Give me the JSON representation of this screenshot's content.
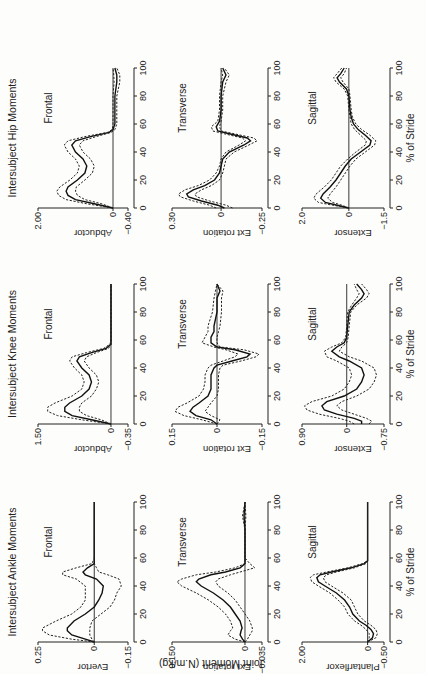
{
  "figure": {
    "ylabel_shared": "Joint Moment (N.m/kg)",
    "xlabel": "% of Stride",
    "x_ticks": [
      "0",
      "20",
      "40",
      "60",
      "80",
      "100"
    ]
  },
  "chart_data": [
    {
      "type": "line",
      "group": "ankle",
      "title": "Intersubject Ankle Moments",
      "panel_label": "Frontal",
      "ylabel": "Evertor",
      "xlabel": "",
      "ylim": [
        -0.15,
        0.25
      ],
      "ytick_labels": [
        "0.25",
        "0",
        "−0.15"
      ],
      "x": [
        0,
        2,
        5,
        8,
        10,
        15,
        20,
        25,
        30,
        35,
        40,
        45,
        48,
        50,
        53,
        56,
        60,
        70,
        80,
        90,
        100
      ],
      "series": [
        {
          "name": "mean",
          "values": [
            0,
            0.04,
            0.1,
            0.12,
            0.12,
            0.09,
            0.04,
            0.0,
            -0.02,
            -0.035,
            -0.04,
            -0.01,
            0.04,
            0.05,
            0.03,
            0.0,
            0,
            0,
            0,
            0,
            0
          ]
        },
        {
          "name": "+1 SD",
          "values": [
            0,
            0.1,
            0.2,
            0.23,
            0.23,
            0.17,
            0.1,
            0.06,
            0.04,
            0.04,
            0.04,
            0.08,
            0.14,
            0.14,
            0.08,
            0.01,
            0,
            0,
            0,
            0,
            0
          ]
        },
        {
          "name": "-1 SD",
          "values": [
            0,
            0.01,
            0.02,
            0.02,
            0.02,
            0.01,
            -0.03,
            -0.07,
            -0.09,
            -0.1,
            -0.12,
            -0.11,
            -0.06,
            -0.02,
            -0.01,
            0.0,
            0,
            0,
            0,
            0,
            0
          ]
        }
      ]
    },
    {
      "type": "line",
      "group": "ankle",
      "title": "",
      "panel_label": "Transverse",
      "ylabel": "Ext rotation",
      "xlabel": "",
      "ylim": [
        -0.035,
        0.15
      ],
      "ytick_labels": [
        "0.150",
        "0",
        "−0.035"
      ],
      "x": [
        0,
        2,
        5,
        8,
        10,
        15,
        20,
        25,
        30,
        35,
        40,
        43,
        45,
        48,
        50,
        53,
        56,
        60,
        70,
        80,
        90,
        100
      ],
      "series": [
        {
          "name": "mean",
          "values": [
            0,
            0.005,
            0.01,
            0.008,
            0.006,
            0.01,
            0.02,
            0.03,
            0.045,
            0.065,
            0.09,
            0.1,
            0.095,
            0.07,
            0.04,
            0.01,
            0.0,
            0,
            0,
            0,
            0.002,
            0
          ]
        },
        {
          "name": "+1 SD",
          "values": [
            0,
            0.02,
            0.035,
            0.03,
            0.025,
            0.03,
            0.04,
            0.055,
            0.075,
            0.1,
            0.13,
            0.14,
            0.13,
            0.1,
            0.06,
            0.02,
            0.0,
            0,
            0,
            0,
            0.005,
            0
          ]
        },
        {
          "name": "-1 SD",
          "values": [
            0,
            -0.005,
            -0.01,
            -0.015,
            -0.015,
            -0.01,
            0.0,
            0.01,
            0.02,
            0.035,
            0.055,
            0.06,
            0.055,
            0.03,
            0.01,
            -0.02,
            -0.01,
            0,
            0,
            0,
            -0.002,
            0
          ]
        }
      ]
    },
    {
      "type": "line",
      "group": "ankle",
      "title": "",
      "panel_label": "Sagittal",
      "ylabel": "Plantarflexor",
      "xlabel": "% of Stride",
      "ylim": [
        -0.5,
        2.0
      ],
      "ytick_labels": [
        "2.00",
        "0",
        "−0.50"
      ],
      "x": [
        0,
        3,
        6,
        9,
        12,
        15,
        20,
        25,
        30,
        35,
        40,
        43,
        46,
        48,
        50,
        53,
        56,
        58,
        60,
        70,
        80,
        90,
        100
      ],
      "series": [
        {
          "name": "mean",
          "values": [
            0,
            -0.15,
            -0.18,
            -0.1,
            0.05,
            0.25,
            0.45,
            0.55,
            0.7,
            0.95,
            1.3,
            1.5,
            1.55,
            1.45,
            1.1,
            0.5,
            0.1,
            0.0,
            0,
            0,
            0,
            0,
            0
          ]
        },
        {
          "name": "+1 SD",
          "values": [
            0,
            -0.05,
            -0.05,
            0.05,
            0.2,
            0.4,
            0.6,
            0.7,
            0.9,
            1.15,
            1.5,
            1.7,
            1.75,
            1.65,
            1.25,
            0.6,
            0.15,
            0.0,
            0,
            0,
            0,
            0,
            0
          ]
        },
        {
          "name": "-1 SD",
          "values": [
            0,
            -0.25,
            -0.3,
            -0.25,
            -0.1,
            0.1,
            0.3,
            0.4,
            0.5,
            0.75,
            1.1,
            1.3,
            1.35,
            1.25,
            0.95,
            0.4,
            0.05,
            0.0,
            0,
            0,
            0,
            0,
            0
          ]
        }
      ]
    },
    {
      "type": "line",
      "group": "knee",
      "title": "Intersubject Knee Moments",
      "panel_label": "Frontal",
      "ylabel": "Abductor",
      "xlabel": "",
      "ylim": [
        -0.35,
        1.5
      ],
      "ytick_labels": [
        "1.50",
        "0",
        "−0.35"
      ],
      "x": [
        0,
        3,
        6,
        9,
        12,
        15,
        20,
        25,
        30,
        35,
        40,
        45,
        48,
        51,
        54,
        57,
        60,
        70,
        80,
        90,
        100
      ],
      "series": [
        {
          "name": "mean",
          "values": [
            0,
            0.4,
            0.8,
            0.95,
            0.95,
            0.85,
            0.6,
            0.45,
            0.4,
            0.45,
            0.6,
            0.7,
            0.65,
            0.4,
            0.1,
            0.0,
            0,
            0,
            0,
            0,
            0
          ]
        },
        {
          "name": "+1 SD",
          "values": [
            0,
            0.6,
            1.1,
            1.3,
            1.3,
            1.15,
            0.8,
            0.6,
            0.55,
            0.6,
            0.75,
            0.85,
            0.8,
            0.5,
            0.15,
            0.02,
            0,
            0,
            0,
            0,
            0
          ]
        },
        {
          "name": "-1 SD",
          "values": [
            0,
            0.2,
            0.5,
            0.65,
            0.65,
            0.6,
            0.4,
            0.3,
            0.25,
            0.3,
            0.45,
            0.55,
            0.5,
            0.3,
            0.05,
            0.0,
            0,
            0,
            0,
            0,
            0
          ]
        }
      ]
    },
    {
      "type": "line",
      "group": "knee",
      "title": "",
      "panel_label": "Transverse",
      "ylabel": "Ext rotation",
      "xlabel": "",
      "ylim": [
        -0.15,
        0.15
      ],
      "ytick_labels": [
        "0.15",
        "0",
        "−0.15"
      ],
      "x": [
        0,
        3,
        6,
        9,
        12,
        15,
        20,
        25,
        30,
        35,
        40,
        42,
        45,
        48,
        50,
        53,
        55,
        58,
        62,
        66,
        70,
        80,
        90,
        95,
        100
      ],
      "series": [
        {
          "name": "mean",
          "values": [
            0,
            0.02,
            0.07,
            0.09,
            0.08,
            0.06,
            0.03,
            0.02,
            0.02,
            0.02,
            0.01,
            0.0,
            -0.05,
            -0.1,
            -0.11,
            -0.06,
            0.0,
            0.02,
            0.02,
            0.01,
            0.01,
            0.0,
            0.0,
            -0.01,
            0
          ]
        },
        {
          "name": "+1 SD",
          "values": [
            0,
            0.05,
            0.11,
            0.14,
            0.13,
            0.1,
            0.06,
            0.045,
            0.04,
            0.04,
            0.03,
            0.02,
            -0.02,
            -0.06,
            -0.07,
            -0.03,
            0.01,
            0.05,
            0.04,
            0.03,
            0.03,
            0.015,
            0.01,
            0.005,
            0
          ]
        },
        {
          "name": "-1 SD",
          "values": [
            0,
            -0.01,
            0.02,
            0.04,
            0.03,
            0.02,
            0.0,
            -0.005,
            -0.005,
            -0.005,
            -0.01,
            -0.02,
            -0.08,
            -0.13,
            -0.14,
            -0.09,
            -0.01,
            0.0,
            0.0,
            -0.005,
            -0.01,
            -0.015,
            -0.015,
            -0.02,
            0
          ]
        }
      ]
    },
    {
      "type": "line",
      "group": "knee",
      "title": "",
      "panel_label": "Sagittal",
      "ylabel": "Extensor",
      "xlabel": "% of Stride",
      "ylim": [
        -0.75,
        0.9
      ],
      "ytick_labels": [
        "0.90",
        "0",
        "−0.75"
      ],
      "x": [
        0,
        2,
        4,
        7,
        10,
        13,
        16,
        20,
        25,
        30,
        35,
        40,
        45,
        48,
        52,
        55,
        58,
        62,
        70,
        80,
        85,
        90,
        93,
        96,
        100
      ],
      "series": [
        {
          "name": "mean",
          "values": [
            -0.3,
            -0.3,
            -0.15,
            0.2,
            0.45,
            0.5,
            0.4,
            0.05,
            -0.2,
            -0.3,
            -0.35,
            -0.3,
            -0.05,
            0.15,
            0.3,
            0.2,
            0.05,
            0.0,
            -0.02,
            -0.05,
            -0.15,
            -0.3,
            -0.35,
            -0.3,
            -0.2
          ]
        },
        {
          "name": "+1 SD",
          "values": [
            -0.15,
            -0.05,
            0.15,
            0.55,
            0.8,
            0.85,
            0.7,
            0.3,
            0.05,
            -0.05,
            -0.1,
            -0.05,
            0.2,
            0.4,
            0.45,
            0.3,
            0.1,
            0.02,
            0.0,
            -0.02,
            -0.1,
            -0.2,
            -0.25,
            -0.2,
            -0.15
          ]
        },
        {
          "name": "-1 SD",
          "values": [
            -0.45,
            -0.5,
            -0.4,
            -0.15,
            0.1,
            0.2,
            0.1,
            -0.2,
            -0.45,
            -0.55,
            -0.6,
            -0.55,
            -0.3,
            -0.05,
            0.15,
            0.1,
            0.0,
            -0.03,
            -0.05,
            -0.08,
            -0.2,
            -0.4,
            -0.45,
            -0.4,
            -0.3
          ]
        }
      ]
    },
    {
      "type": "line",
      "group": "hip",
      "title": "Intersubject Hip Moments",
      "panel_label": "Frontal",
      "ylabel": "Abductor",
      "xlabel": "",
      "ylim": [
        -0.4,
        2.0
      ],
      "ytick_labels": [
        "2.00",
        "0",
        "−0.40"
      ],
      "x": [
        0,
        3,
        6,
        9,
        12,
        15,
        20,
        25,
        30,
        35,
        40,
        45,
        48,
        51,
        54,
        56,
        60,
        70,
        80,
        90,
        95,
        100
      ],
      "series": [
        {
          "name": "mean",
          "values": [
            0,
            0.5,
            1.0,
            1.2,
            1.25,
            1.2,
            0.95,
            0.75,
            0.7,
            0.8,
            1.0,
            1.1,
            1.0,
            0.6,
            0.1,
            0.0,
            -0.05,
            -0.05,
            -0.05,
            -0.1,
            -0.1,
            -0.05
          ]
        },
        {
          "name": "+1 SD",
          "values": [
            0,
            0.7,
            1.25,
            1.45,
            1.5,
            1.42,
            1.15,
            0.95,
            0.9,
            1.0,
            1.2,
            1.3,
            1.2,
            0.75,
            0.15,
            0.02,
            0.0,
            0.0,
            0.0,
            -0.03,
            -0.02,
            0.0
          ]
        },
        {
          "name": "-1 SD",
          "values": [
            0,
            0.3,
            0.75,
            0.95,
            1.0,
            0.98,
            0.75,
            0.55,
            0.5,
            0.6,
            0.8,
            0.9,
            0.8,
            0.45,
            0.05,
            -0.05,
            -0.1,
            -0.1,
            -0.1,
            -0.18,
            -0.18,
            -0.1
          ]
        }
      ]
    },
    {
      "type": "line",
      "group": "hip",
      "title": "",
      "panel_label": "Transverse",
      "ylabel": "Ext rotation",
      "xlabel": "",
      "ylim": [
        -0.25,
        0.3
      ],
      "ytick_labels": [
        "0.30",
        "0",
        "−0.25"
      ],
      "x": [
        0,
        2,
        5,
        8,
        10,
        13,
        16,
        20,
        25,
        30,
        35,
        40,
        45,
        48,
        50,
        53,
        55,
        58,
        62,
        70,
        80,
        90,
        95,
        100
      ],
      "series": [
        {
          "name": "mean",
          "values": [
            -0.02,
            0.02,
            0.12,
            0.2,
            0.21,
            0.17,
            0.1,
            0.04,
            0.01,
            0.0,
            -0.01,
            -0.05,
            -0.14,
            -0.18,
            -0.16,
            -0.05,
            0.02,
            0.03,
            0.01,
            0.0,
            0.0,
            -0.01,
            -0.03,
            -0.01
          ]
        },
        {
          "name": "+1 SD",
          "values": [
            0.03,
            0.07,
            0.17,
            0.25,
            0.26,
            0.22,
            0.14,
            0.07,
            0.03,
            0.01,
            0.0,
            -0.03,
            -0.11,
            -0.15,
            -0.13,
            -0.02,
            0.05,
            0.06,
            0.02,
            0.01,
            0.01,
            0.0,
            -0.01,
            0.0
          ]
        },
        {
          "name": "-1 SD",
          "values": [
            -0.07,
            -0.03,
            0.07,
            0.15,
            0.16,
            0.12,
            0.06,
            0.01,
            -0.01,
            -0.02,
            -0.03,
            -0.08,
            -0.17,
            -0.22,
            -0.2,
            -0.08,
            0.0,
            0.01,
            0.0,
            -0.01,
            -0.01,
            -0.03,
            -0.05,
            -0.02
          ]
        }
      ]
    },
    {
      "type": "line",
      "group": "hip",
      "title": "",
      "panel_label": "Sagittal",
      "ylabel": "Extensor",
      "xlabel": "% of Stride",
      "ylim": [
        -1.5,
        2.0
      ],
      "ytick_labels": [
        "2.0",
        "0",
        "−1.5"
      ],
      "x": [
        0,
        2,
        4,
        7,
        10,
        15,
        20,
        25,
        30,
        35,
        40,
        45,
        48,
        52,
        56,
        60,
        65,
        70,
        80,
        85,
        90,
        93,
        96,
        100
      ],
      "series": [
        {
          "name": "mean",
          "values": [
            0,
            0.5,
            1.0,
            1.2,
            1.1,
            0.8,
            0.55,
            0.35,
            0.15,
            -0.1,
            -0.5,
            -0.9,
            -0.95,
            -0.7,
            -0.4,
            -0.2,
            -0.1,
            -0.05,
            0.0,
            0.1,
            0.4,
            0.5,
            0.35,
            0.2
          ]
        },
        {
          "name": "+1 SD",
          "values": [
            0,
            0.7,
            1.3,
            1.5,
            1.4,
            1.05,
            0.75,
            0.55,
            0.35,
            0.05,
            -0.3,
            -0.7,
            -0.75,
            -0.5,
            -0.25,
            -0.1,
            -0.05,
            0.0,
            0.05,
            0.2,
            0.55,
            0.65,
            0.5,
            0.3
          ]
        },
        {
          "name": "-1 SD",
          "values": [
            0,
            0.3,
            0.7,
            0.9,
            0.8,
            0.55,
            0.35,
            0.15,
            -0.05,
            -0.3,
            -0.7,
            -1.1,
            -1.15,
            -0.9,
            -0.55,
            -0.3,
            -0.15,
            -0.1,
            -0.05,
            0.0,
            0.25,
            0.35,
            0.2,
            0.1
          ]
        }
      ]
    }
  ]
}
